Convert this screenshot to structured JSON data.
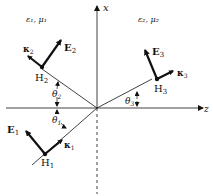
{
  "figure": {
    "type": "oblique-incidence-diagram",
    "axes": {
      "vertical": {
        "label": "x"
      },
      "horizontal": {
        "label": "z"
      }
    },
    "media": [
      {
        "name": "medium-1",
        "label": "ε₁, μ₁"
      },
      {
        "name": "medium-2",
        "label": "ε₂, μ₂"
      }
    ],
    "waves": {
      "incident": {
        "E": "E",
        "E_sub": "1",
        "H": "H",
        "H_sub": "1",
        "k": "κ",
        "k_sub": "1",
        "angle": "θ",
        "angle_sub": "1"
      },
      "reflected": {
        "E": "E",
        "E_sub": "2",
        "H": "H",
        "H_sub": "2",
        "k": "κ",
        "k_sub": "2",
        "angle": "θ",
        "angle_sub": "2"
      },
      "transmitted": {
        "E": "E",
        "E_sub": "3",
        "H": "H",
        "H_sub": "3",
        "k": "κ",
        "k_sub": "3",
        "angle": "θ",
        "angle_sub": "3"
      }
    },
    "colors": {
      "ink": "#111111",
      "background": "#ffffff"
    }
  }
}
